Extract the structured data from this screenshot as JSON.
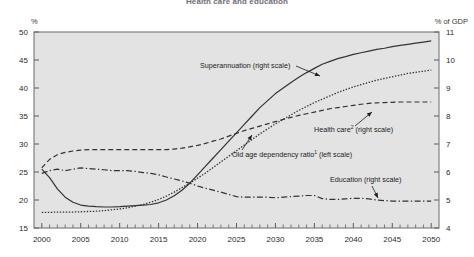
{
  "chart_data": {
    "type": "line",
    "title": "Health care and education",
    "xlabel": "",
    "ylabel_left": "%",
    "ylabel_right": "% of GDP",
    "grid": false,
    "legend_position": "inline-annotations",
    "plot_background": "#e3e3e3",
    "frame_color": "#6a6a6a",
    "x": [
      2000,
      2001,
      2002,
      2003,
      2004,
      2005,
      2006,
      2007,
      2008,
      2009,
      2010,
      2011,
      2012,
      2013,
      2014,
      2015,
      2016,
      2017,
      2018,
      2019,
      2020,
      2021,
      2022,
      2023,
      2024,
      2025,
      2026,
      2027,
      2028,
      2029,
      2030,
      2031,
      2032,
      2033,
      2034,
      2035,
      2036,
      2037,
      2038,
      2039,
      2040,
      2041,
      2042,
      2043,
      2044,
      2045,
      2046,
      2047,
      2048,
      2049,
      2050
    ],
    "xlim": [
      1999,
      2051
    ],
    "xticks": [
      2000,
      2005,
      2010,
      2015,
      2020,
      2025,
      2030,
      2035,
      2040,
      2045,
      2050
    ],
    "xtick_labels": [
      "2000",
      "2005",
      "2010",
      "2015",
      "2020",
      "2025",
      "2030",
      "2035",
      "2040",
      "2045",
      "2050"
    ],
    "xminor_step": 1,
    "ylim_left": [
      15,
      50
    ],
    "yticks_left": [
      15,
      20,
      25,
      30,
      35,
      40,
      45,
      50
    ],
    "ytick_labels_left": [
      "15",
      "20",
      "25",
      "30",
      "35",
      "40",
      "45",
      "50"
    ],
    "ylim_right": [
      4,
      11
    ],
    "yticks_right": [
      4,
      5,
      6,
      7,
      8,
      9,
      10,
      11
    ],
    "ytick_labels_right": [
      "4",
      "5",
      "6",
      "7",
      "8",
      "9",
      "10",
      "11"
    ],
    "series": [
      {
        "name": "Superannuation",
        "label": "Superannuation (right scale)",
        "scale": "right",
        "style": "solid",
        "color": "#333333",
        "width": 1.2,
        "values": [
          6.1,
          5.8,
          5.4,
          5.1,
          4.92,
          4.82,
          4.78,
          4.76,
          4.75,
          4.75,
          4.76,
          4.78,
          4.8,
          4.82,
          4.84,
          4.9,
          5.0,
          5.15,
          5.35,
          5.6,
          5.9,
          6.2,
          6.5,
          6.8,
          7.1,
          7.4,
          7.7,
          8.0,
          8.3,
          8.55,
          8.8,
          9.0,
          9.2,
          9.38,
          9.55,
          9.7,
          9.85,
          9.95,
          10.05,
          10.12,
          10.2,
          10.26,
          10.32,
          10.38,
          10.42,
          10.48,
          10.52,
          10.56,
          10.6,
          10.64,
          10.68
        ]
      },
      {
        "name": "Old age dependency ratio",
        "label": "Old age dependency ratio (left scale)",
        "label_sup": "1",
        "scale": "left",
        "style": "dotted",
        "color": "#333333",
        "width": 1.3,
        "values": [
          17.8,
          17.8,
          17.85,
          17.85,
          17.85,
          17.9,
          17.95,
          18.0,
          18.1,
          18.25,
          18.4,
          18.6,
          18.9,
          19.2,
          19.6,
          20.1,
          20.7,
          21.4,
          22.2,
          23.0,
          23.9,
          24.8,
          25.8,
          26.8,
          27.8,
          28.8,
          29.8,
          30.8,
          31.8,
          32.7,
          33.6,
          34.4,
          35.2,
          36.0,
          36.7,
          37.4,
          38.0,
          38.6,
          39.2,
          39.7,
          40.2,
          40.6,
          41.0,
          41.4,
          41.7,
          42.0,
          42.3,
          42.6,
          42.8,
          43.0,
          43.2
        ]
      },
      {
        "name": "Health care",
        "label": "Health care (right scale)",
        "label_sup": "2",
        "scale": "right",
        "style": "dashed",
        "color": "#333333",
        "width": 1.2,
        "values": [
          6.15,
          6.45,
          6.62,
          6.7,
          6.75,
          6.78,
          6.8,
          6.8,
          6.8,
          6.8,
          6.8,
          6.8,
          6.8,
          6.8,
          6.8,
          6.8,
          6.8,
          6.82,
          6.85,
          6.9,
          6.95,
          7.02,
          7.1,
          7.18,
          7.28,
          7.38,
          7.48,
          7.56,
          7.64,
          7.72,
          7.8,
          7.88,
          7.95,
          8.02,
          8.08,
          8.14,
          8.2,
          8.26,
          8.3,
          8.34,
          8.38,
          8.42,
          8.45,
          8.47,
          8.48,
          8.49,
          8.5,
          8.5,
          8.5,
          8.5,
          8.5
        ]
      },
      {
        "name": "Education",
        "label": "Education (right scale)",
        "scale": "right",
        "style": "dashdot",
        "color": "#333333",
        "width": 1.2,
        "values": [
          5.95,
          6.05,
          6.1,
          6.05,
          6.1,
          6.15,
          6.12,
          6.1,
          6.08,
          6.05,
          6.05,
          6.05,
          6.02,
          5.98,
          5.95,
          5.9,
          5.82,
          5.75,
          5.68,
          5.6,
          5.5,
          5.42,
          5.35,
          5.28,
          5.2,
          5.12,
          5.1,
          5.1,
          5.1,
          5.1,
          5.08,
          5.1,
          5.12,
          5.14,
          5.16,
          5.16,
          5.05,
          5.02,
          5.02,
          5.04,
          5.06,
          5.06,
          5.04,
          5.0,
          4.98,
          4.96,
          4.96,
          4.96,
          4.96,
          4.96,
          4.96
        ]
      }
    ],
    "annotations": [
      {
        "name": "superannuation-label",
        "text": "Superannuation (right scale)",
        "sup": "",
        "x": 200,
        "y": 68,
        "leader": {
          "x1": 296,
          "y1": 66,
          "x2": 320,
          "y2": 76
        },
        "arrow": true
      },
      {
        "name": "health-care-label",
        "text": "Health care",
        "sup": "2",
        "text_after": " (right scale)",
        "x": 314,
        "y": 132,
        "leader": {
          "x1": 355,
          "y1": 126,
          "x2": 372,
          "y2": 112
        },
        "arrow": true
      },
      {
        "name": "old-age-dependency-label",
        "text": "Old age dependency ratio",
        "sup": "1",
        "text_after": " (left scale)",
        "x": 232,
        "y": 157,
        "leader": {
          "x1": 242,
          "y1": 150,
          "x2": 252,
          "y2": 135
        },
        "arrow": true
      },
      {
        "name": "education-label",
        "text": "Education (right scale)",
        "sup": "",
        "x": 330,
        "y": 182,
        "leader": {
          "x1": 372,
          "y1": 186,
          "x2": 378,
          "y2": 198
        },
        "arrow": true
      }
    ]
  }
}
